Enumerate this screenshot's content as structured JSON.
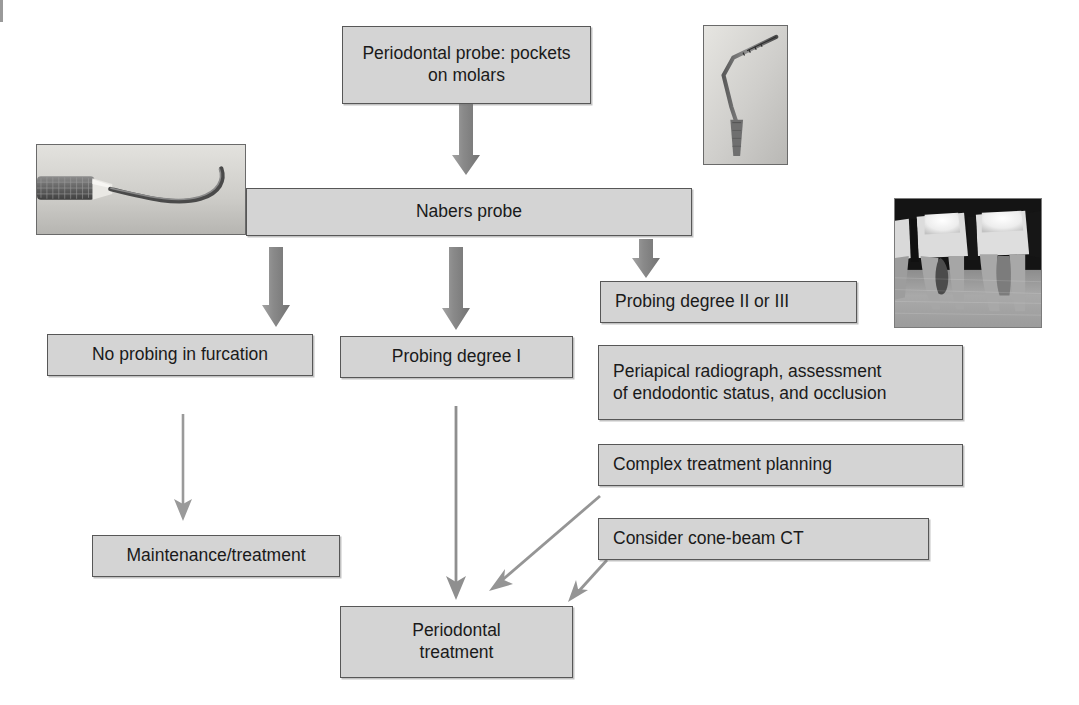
{
  "diagram": {
    "accent_box_fill": "#d4d4d4",
    "accent_box_border": "#575757",
    "thick_arrow_color": "#8c8c8c",
    "thin_arrow_color": "#9a9a9a",
    "nodes": [
      {
        "id": "probe",
        "label": "Periodontal probe: pockets\non molars"
      },
      {
        "id": "nabers",
        "label": "Nabers probe"
      },
      {
        "id": "no-probing",
        "label": "No probing in furcation"
      },
      {
        "id": "degree-1",
        "label": "Probing degree I"
      },
      {
        "id": "degree-2-3",
        "label": "Probing degree II or III"
      },
      {
        "id": "periapical",
        "label": "Periapical radiograph, assessment\nof endodontic status, and occlusion"
      },
      {
        "id": "complex-plan",
        "label": "Complex treatment planning"
      },
      {
        "id": "cone-beam",
        "label": "Consider cone-beam CT"
      },
      {
        "id": "maintenance",
        "label": "Maintenance/treatment"
      },
      {
        "id": "perio-treatment",
        "label": "Periodontal\ntreatment"
      }
    ],
    "photos": [
      {
        "id": "periodontal-probe-photo",
        "alt": "periodontal probe instrument tip"
      },
      {
        "id": "nabers-probe-photo",
        "alt": "curved Nabers probe instrument"
      },
      {
        "id": "radiograph-photo",
        "alt": "periapical radiograph of two molars"
      }
    ]
  }
}
